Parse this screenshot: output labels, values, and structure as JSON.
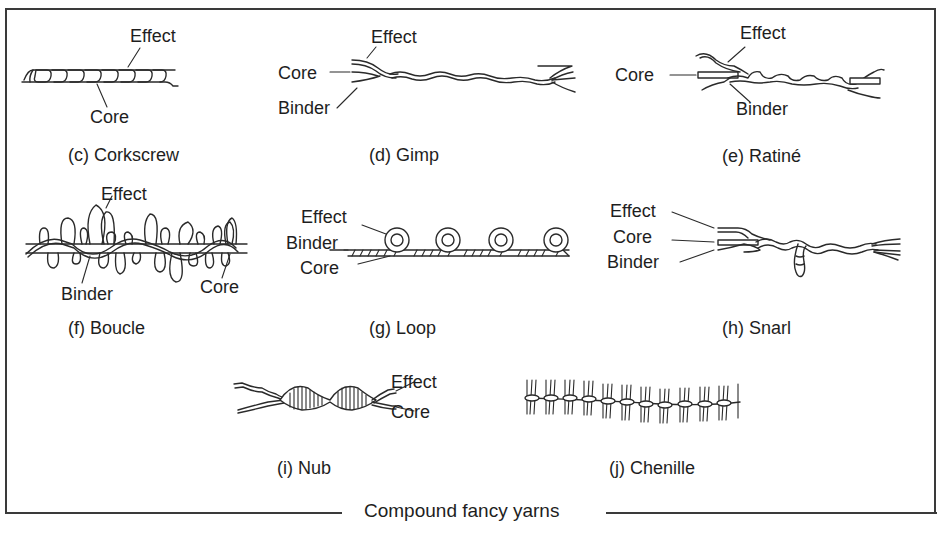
{
  "figure": {
    "title": "Compound fancy yarns",
    "panels": [
      {
        "id": "c",
        "caption": "(c) Corkscrew",
        "labels": {
          "effect": "Effect",
          "core": "Core"
        }
      },
      {
        "id": "d",
        "caption": "(d) Gimp",
        "labels": {
          "effect": "Effect",
          "core": "Core",
          "binder": "Binder"
        }
      },
      {
        "id": "e",
        "caption": "(e) Ratiné",
        "labels": {
          "effect": "Effect",
          "core": "Core",
          "binder": "Binder"
        }
      },
      {
        "id": "f",
        "caption": "(f) Boucle",
        "labels": {
          "effect": "Effect",
          "binder": "Binder",
          "core": "Core"
        }
      },
      {
        "id": "g",
        "caption": "(g) Loop",
        "labels": {
          "effect": "Effect",
          "binder": "Binder",
          "core": "Core"
        }
      },
      {
        "id": "h",
        "caption": "(h) Snarl",
        "labels": {
          "effect": "Effect",
          "core": "Core",
          "binder": "Binder"
        }
      },
      {
        "id": "i",
        "caption": "(i) Nub",
        "labels": {
          "effect": "Effect",
          "core": "Core"
        }
      },
      {
        "id": "j",
        "caption": "(j) Chenille",
        "labels": {}
      }
    ]
  },
  "colors": {
    "line": "#2a2a2a",
    "frame": "#3a3a3a",
    "background": "#ffffff",
    "text": "#1e1e1e"
  }
}
